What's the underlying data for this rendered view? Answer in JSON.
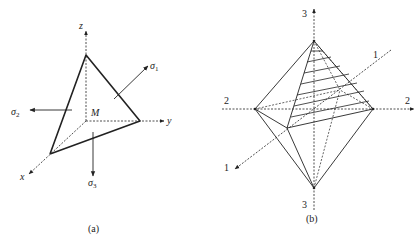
{
  "panel_a": {
    "caption": "(a)",
    "axes": {
      "x": "x",
      "y": "y",
      "z": "z"
    },
    "origin_label": "M",
    "stresses": [
      {
        "symbol": "σ",
        "sub": "1"
      },
      {
        "symbol": "σ",
        "sub": "2"
      },
      {
        "symbol": "σ",
        "sub": "3"
      }
    ]
  },
  "panel_b": {
    "caption": "(b)",
    "axis_labels": {
      "axis3_top": "3",
      "axis3_bottom": "3",
      "axis2_left": "2",
      "axis2_right": "2",
      "axis1_back": "1",
      "axis1_front": "1"
    }
  },
  "colors": {
    "line": "#222222",
    "background": "#ffffff"
  }
}
